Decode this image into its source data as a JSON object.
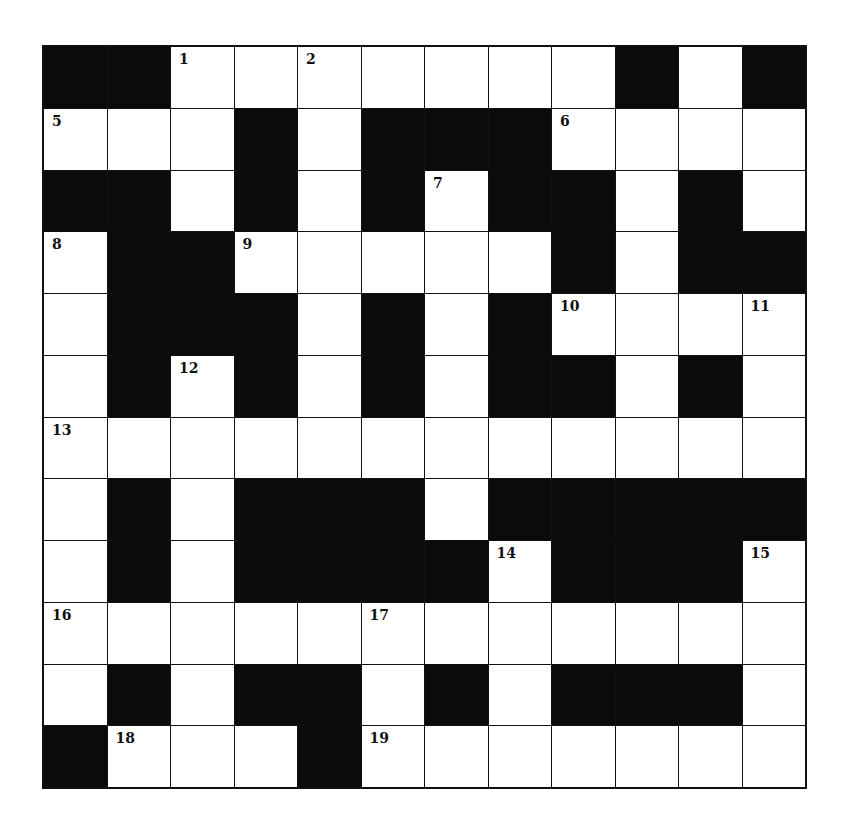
{
  "puzzle": {
    "rows": 12,
    "cols": 12,
    "colors": {
      "block": "#0b0b0b",
      "cell": "#ffffff",
      "border": "#111111"
    },
    "layout": [
      "##.......#.#",
      "...#.###....",
      "##.#.#.##.#.",
      ".##.....#.##",
      ".###.#.#....",
      ".#.#.#.##.#.",
      "............",
      ".#.###.#####",
      ".#.####.###.",
      "............",
      ".#.##.#.###.",
      "#...#......."
    ],
    "numbers": [
      {
        "row": 0,
        "col": 2,
        "n": "1"
      },
      {
        "row": 0,
        "col": 4,
        "n": "2"
      },
      {
        "row": 0,
        "col": 9,
        "n": "3"
      },
      {
        "row": 0,
        "col": 11,
        "n": "4"
      },
      {
        "row": 1,
        "col": 0,
        "n": "5"
      },
      {
        "row": 1,
        "col": 8,
        "n": "6"
      },
      {
        "row": 2,
        "col": 6,
        "n": "7"
      },
      {
        "row": 3,
        "col": 0,
        "n": "8"
      },
      {
        "row": 3,
        "col": 3,
        "n": "9"
      },
      {
        "row": 4,
        "col": 8,
        "n": "10"
      },
      {
        "row": 4,
        "col": 11,
        "n": "11"
      },
      {
        "row": 5,
        "col": 2,
        "n": "12"
      },
      {
        "row": 6,
        "col": 0,
        "n": "13"
      },
      {
        "row": 8,
        "col": 7,
        "n": "14"
      },
      {
        "row": 8,
        "col": 11,
        "n": "15"
      },
      {
        "row": 9,
        "col": 0,
        "n": "16"
      },
      {
        "row": 9,
        "col": 5,
        "n": "17"
      },
      {
        "row": 11,
        "col": 1,
        "n": "18"
      },
      {
        "row": 11,
        "col": 5,
        "n": "19"
      }
    ]
  }
}
